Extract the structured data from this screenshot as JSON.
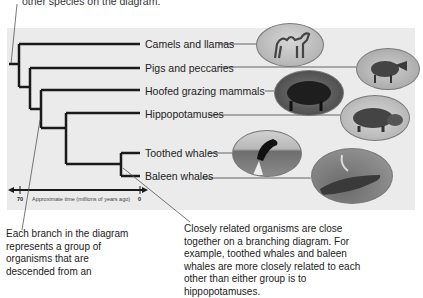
{
  "top_caption": "other species on the diagram.",
  "taxa": [
    {
      "label": "Camels and llamas",
      "icon": "camel-photo"
    },
    {
      "label": "Pigs and peccaries",
      "icon": "pig-photo"
    },
    {
      "label": "Hoofed grazing mammals",
      "icon": "bison-photo"
    },
    {
      "label": "Hippopotamuses",
      "icon": "hippo-photo"
    },
    {
      "label": "Toothed whales",
      "icon": "orca-photo"
    },
    {
      "label": "Baleen whales",
      "icon": "humpback-whale-photo"
    }
  ],
  "axis": {
    "label": "Approximate time (millions of years ago)",
    "start_tick": "70",
    "end_tick": "0"
  },
  "callouts": {
    "left": "Each branch in the diagram represents a group of organisms that are descended from an",
    "right": "Closely related organisms are close together on a branching diagram. For example, toothed whales and baleen whales are more closely related to each other than either group is to hippopotamuses."
  },
  "colors": {
    "panel": "#ebebeb",
    "branch": "#1a1a1a",
    "leader": "#555555"
  }
}
